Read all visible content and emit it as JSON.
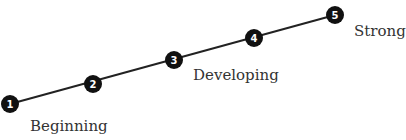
{
  "diagram": {
    "type": "progression-scale",
    "nodes": [
      {
        "number": "1",
        "x": 10,
        "y": 104
      },
      {
        "number": "2",
        "x": 93,
        "y": 84
      },
      {
        "number": "3",
        "x": 174,
        "y": 60
      },
      {
        "number": "4",
        "x": 254,
        "y": 38
      },
      {
        "number": "5",
        "x": 335,
        "y": 15
      }
    ],
    "labels": {
      "beginning": "Beginning",
      "developing": "Developing",
      "strong": "Strong"
    },
    "colors": {
      "line": "#222222",
      "node": "#111111",
      "text": "#333333"
    }
  }
}
